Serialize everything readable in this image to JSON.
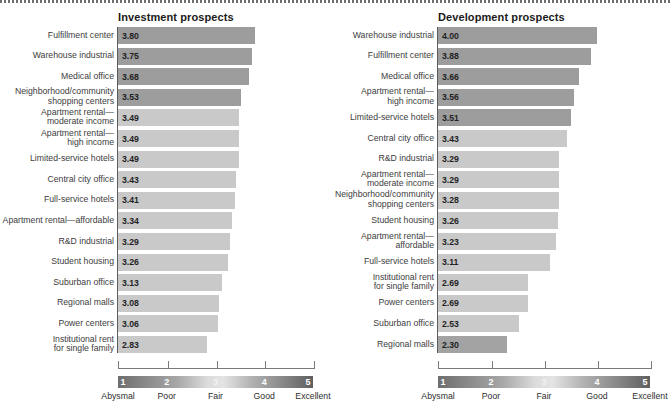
{
  "figure": {
    "top_rule": "dotted-rule"
  },
  "chart_data": {
    "type": "bar",
    "title": "",
    "xlabel": "",
    "ylabel": "",
    "xlim": [
      1,
      5
    ],
    "grid": false,
    "orientation": "horizontal",
    "scale_legend": {
      "ticks": [
        "1",
        "2",
        "3",
        "4",
        "5"
      ],
      "words": [
        "Abysmal",
        "Poor",
        "Fair",
        "Good",
        "Excellent"
      ],
      "colors": [
        "#6e6e6e",
        "#9a9a9a",
        "#e0e0e0",
        "#a8a8a8",
        "#5f5f5f"
      ]
    },
    "panels": [
      {
        "key": "investment",
        "title": "Investment prospects",
        "categories": [
          "Fulfillment center",
          "Warehouse industrial",
          "Medical office",
          "Neighborhood/community\nshopping centers",
          "Apartment rental—\nmoderate income",
          "Apartment rental—\nhigh income",
          "Limited-service hotels",
          "Central city office",
          "Full-service hotels",
          "Apartment rental—affordable",
          "R&D industrial",
          "Student housing",
          "Suburban office",
          "Regional malls",
          "Power centers",
          "Institutional rent\nfor single family"
        ],
        "values": [
          3.8,
          3.75,
          3.68,
          3.53,
          3.49,
          3.49,
          3.49,
          3.43,
          3.41,
          3.34,
          3.29,
          3.26,
          3.13,
          3.08,
          3.06,
          2.83
        ],
        "labels": [
          "3.80",
          "3.75",
          "3.68",
          "3.53",
          "3.49",
          "3.49",
          "3.49",
          "3.43",
          "3.41",
          "3.34",
          "3.29",
          "3.26",
          "3.13",
          "3.08",
          "3.06",
          "2.83"
        ],
        "colors": [
          "#9d9d9d",
          "#9d9d9d",
          "#9d9d9d",
          "#9d9d9d",
          "#c9c9c9",
          "#c9c9c9",
          "#c9c9c9",
          "#c9c9c9",
          "#c9c9c9",
          "#c9c9c9",
          "#c9c9c9",
          "#c9c9c9",
          "#c9c9c9",
          "#c9c9c9",
          "#c9c9c9",
          "#c9c9c9"
        ]
      },
      {
        "key": "development",
        "title": "Development prospects",
        "categories": [
          "Warehouse industrial",
          "Fulfillment center",
          "Medical office",
          "Apartment rental—\nhigh income",
          "Limited-service hotels",
          "Central city office",
          "R&D industrial",
          "Apartment rental—\nmoderate income",
          "Neighborhood/community\nshopping centers",
          "Student housing",
          "Apartment rental—affordable",
          "Full-service hotels",
          "Institutional rent\nfor single family",
          "Power centers",
          "Suburban office",
          "Regional malls"
        ],
        "values": [
          4.0,
          3.88,
          3.66,
          3.56,
          3.51,
          3.43,
          3.29,
          3.29,
          3.28,
          3.26,
          3.23,
          3.11,
          2.69,
          2.69,
          2.53,
          2.3
        ],
        "labels": [
          "4.00",
          "3.88",
          "3.66",
          "3.56",
          "3.51",
          "3.43",
          "3.29",
          "3.29",
          "3.28",
          "3.26",
          "3.23",
          "3.11",
          "2.69",
          "2.69",
          "2.53",
          "2.30"
        ],
        "colors": [
          "#9d9d9d",
          "#9d9d9d",
          "#9d9d9d",
          "#9d9d9d",
          "#9d9d9d",
          "#c9c9c9",
          "#c9c9c9",
          "#c9c9c9",
          "#c9c9c9",
          "#c9c9c9",
          "#c9c9c9",
          "#c9c9c9",
          "#c9c9c9",
          "#c9c9c9",
          "#c9c9c9",
          "#a3a3a3"
        ]
      }
    ]
  }
}
